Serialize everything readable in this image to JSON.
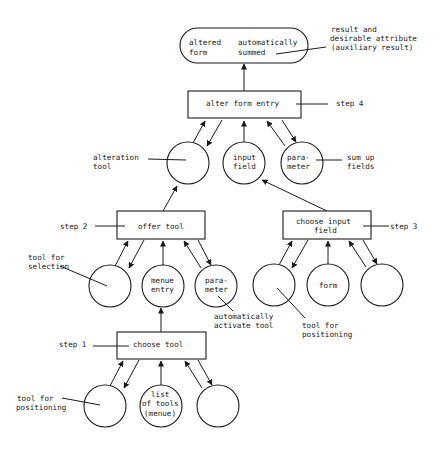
{
  "diagram": {
    "result": {
      "left_line1": "altered",
      "left_line2": "form",
      "right_line1": "automatically",
      "right_line2": "summed",
      "annotation_line1": "result  and",
      "annotation_line2": "desirable  attribute",
      "annotation_line3": "(auxiliary result)"
    },
    "step4": {
      "label": "step 4",
      "box": "alter form entry",
      "circles": [
        {
          "line1": "",
          "line2": "",
          "annotation_line1": "alteration",
          "annotation_line2": "tool"
        },
        {
          "line1": "input",
          "line2": "field"
        },
        {
          "line1": "para-",
          "line2": "meter",
          "annotation_line1": "sum up",
          "annotation_line2": "fields"
        }
      ]
    },
    "step2": {
      "label": "step 2",
      "box": "offer tool",
      "circles": [
        {
          "line1": "",
          "line2": "",
          "annotation_line1": "tool for",
          "annotation_line2": "selection"
        },
        {
          "line1": "menue",
          "line2": "entry"
        },
        {
          "line1": "para-",
          "line2": "meter",
          "annotation_line1": "automatically",
          "annotation_line2": "activate tool"
        }
      ]
    },
    "step3": {
      "label": "step 3",
      "box_line1": "choose input",
      "box_line2": "field",
      "circles": [
        {
          "line1": "",
          "annotation_line1": "tool  for",
          "annotation_line2": "positioning"
        },
        {
          "line1": "form"
        },
        {
          "line1": ""
        }
      ]
    },
    "step1": {
      "label": "step 1",
      "box": "choose tool",
      "circles": [
        {
          "line1": "",
          "annotation_line1": "tool  for",
          "annotation_line2": "positioning"
        },
        {
          "line1": "list",
          "line2": "of tools",
          "line3": "(menue)"
        },
        {
          "line1": ""
        }
      ]
    }
  }
}
